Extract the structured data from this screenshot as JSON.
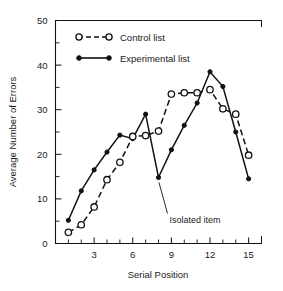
{
  "chart_data": {
    "type": "line",
    "title": "",
    "xlabel": "Serial Position",
    "ylabel": "Average Number of Errors",
    "xlim": [
      0,
      16
    ],
    "ylim": [
      0,
      50
    ],
    "grid": false,
    "legend_position": "top-left-inside",
    "x_ticks_major": [
      3,
      6,
      9,
      12,
      15
    ],
    "x_ticks_all": [
      1,
      2,
      3,
      4,
      5,
      6,
      7,
      8,
      9,
      10,
      11,
      12,
      13,
      14,
      15
    ],
    "x_tick_labels": [
      "3",
      "6",
      "9",
      "12",
      "15"
    ],
    "y_ticks_major": [
      0,
      10,
      20,
      30,
      40,
      50
    ],
    "y_ticks_minor": [
      5,
      15,
      25,
      35,
      45
    ],
    "y_tick_labels": [
      "0",
      "10",
      "20",
      "30",
      "40",
      "50"
    ],
    "x": [
      1,
      2,
      3,
      4,
      5,
      6,
      7,
      8,
      9,
      10,
      11,
      12,
      13,
      14,
      15
    ],
    "series": [
      {
        "name": "Control list",
        "marker": "open-circle",
        "line": "dashed",
        "values": [
          2.5,
          4.2,
          8.2,
          14.3,
          18.2,
          24.0,
          24.2,
          25.2,
          33.5,
          33.8,
          33.8,
          34.5,
          30.2,
          29.0,
          19.8
        ]
      },
      {
        "name": "Experimental list",
        "marker": "filled-circle",
        "line": "solid",
        "values": [
          5.2,
          11.8,
          16.5,
          20.5,
          24.3,
          23.5,
          29.0,
          14.8,
          21.0,
          26.5,
          31.5,
          38.5,
          35.2,
          25.0,
          14.5
        ]
      }
    ],
    "annotations": [
      {
        "text": "Isolated item",
        "points_to_x": 8,
        "points_to_y": 14.8
      }
    ]
  },
  "legend": {
    "items": [
      {
        "label": "Control list"
      },
      {
        "label": "Experimental list"
      }
    ]
  },
  "axis": {
    "x_title": "Serial Position",
    "y_title": "Average Number of Errors"
  },
  "colors": {
    "ink": "#111111",
    "background": "#ffffff"
  }
}
